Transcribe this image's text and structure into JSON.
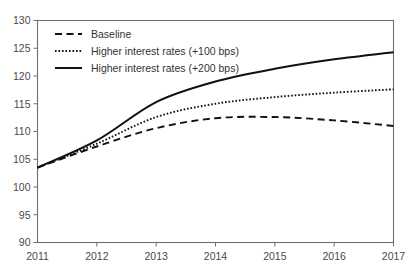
{
  "chart_data": {
    "type": "line",
    "title": "",
    "xlabel": "",
    "ylabel": "",
    "x": [
      2011,
      2012,
      2013,
      2014,
      2015,
      2016,
      2017
    ],
    "categories": [
      "2011",
      "2012",
      "2013",
      "2014",
      "2015",
      "2016",
      "2017"
    ],
    "xlim": [
      2011,
      2017
    ],
    "ylim": [
      90,
      130
    ],
    "yticks": [
      90,
      95,
      100,
      105,
      110,
      115,
      120,
      125,
      130
    ],
    "ytick_labels": [
      "90",
      "95",
      "100",
      "105",
      "110",
      "115",
      "120",
      "125",
      "130"
    ],
    "xticks": [
      2011,
      2012,
      2013,
      2014,
      2015,
      2016,
      2017
    ],
    "xtick_labels": [
      "2011",
      "2012",
      "2013",
      "2014",
      "2015",
      "2016",
      "2017"
    ],
    "grid": false,
    "legend_position": "top-left",
    "series": [
      {
        "name": "Baseline",
        "style": "dashed",
        "color": "#111111",
        "values": [
          103.5,
          107.3,
          110.6,
          112.4,
          112.6,
          112.0,
          111.0
        ]
      },
      {
        "name": "Higher interest rates (+100 bps)",
        "style": "dotted",
        "color": "#111111",
        "values": [
          103.5,
          107.8,
          112.6,
          115.0,
          116.2,
          117.0,
          117.6
        ]
      },
      {
        "name": "Higher interest rates (+200 bps)",
        "style": "solid",
        "color": "#111111",
        "values": [
          103.5,
          108.4,
          115.3,
          119.0,
          121.3,
          123.0,
          124.3
        ]
      }
    ]
  },
  "legend": {
    "entries": [
      {
        "label": "Baseline",
        "style": "dashed"
      },
      {
        "label": "Higher interest rates (+100 bps)",
        "style": "dotted"
      },
      {
        "label": "Higher interest rates (+200 bps)",
        "style": "solid"
      }
    ]
  },
  "colors": {
    "line": "#111111",
    "axis": "#6e6e6e",
    "text": "#3a3a3a",
    "background": "#ffffff"
  }
}
